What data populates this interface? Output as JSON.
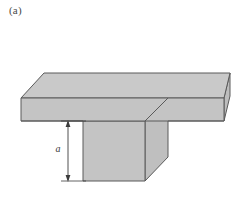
{
  "figure": {
    "panel_label": "(a)",
    "caption_position": "top-left",
    "shape_name": "t-section-solid",
    "dimension": {
      "label": "a",
      "measures": "stem-height",
      "arrow_style": "double-ended",
      "orientation": "vertical"
    },
    "colors": {
      "top_face": "#c9c9c9",
      "front_face": "#c4c4c4",
      "side_face": "#bdbdbd",
      "stem_side_face": "#bfbfbf",
      "outline": "#5a5a5a",
      "dimension_line": "#3c3c3c",
      "background": "#ffffff",
      "label_text": "#4a4a4a"
    },
    "geometry": {
      "flange_top_face": "44,73 230,73 224,98 21,98",
      "flange_front_face": "21,98 224,98 224,121 21,121",
      "flange_right_face": "230,73 230,96 224,121 224,98",
      "stem_front_face": "83,121 145,121 145,181 83,181",
      "stem_right_face": "145,121 168,98 168,157 145,181",
      "dimension_x": 68,
      "dimension_top_y": 121,
      "dimension_bottom_y": 181
    }
  }
}
